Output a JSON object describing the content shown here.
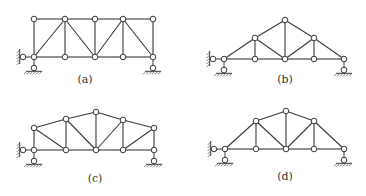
{
  "figure": {
    "node_radius": 2.8,
    "colors": {
      "line": "#3a3a3a",
      "node_fill": "#ffffff",
      "background": "#ffffff"
    },
    "panels": [
      {
        "id": "a",
        "label": "(a)",
        "label_pos": [
          85,
          83
        ],
        "nodes": {
          "B1": [
            34,
            57
          ],
          "B2": [
            65,
            57
          ],
          "B3": [
            95,
            57
          ],
          "B4": [
            123,
            57
          ],
          "B5": [
            153,
            57
          ],
          "T1": [
            34,
            19
          ],
          "T2": [
            65,
            19
          ],
          "T3": [
            95,
            19
          ],
          "T4": [
            123,
            19
          ],
          "T5": [
            153,
            19
          ]
        },
        "members": [
          [
            "B1",
            "B2"
          ],
          [
            "B2",
            "B3"
          ],
          [
            "B3",
            "B4"
          ],
          [
            "B4",
            "B5"
          ],
          [
            "T1",
            "T2"
          ],
          [
            "T2",
            "T3"
          ],
          [
            "T3",
            "T4"
          ],
          [
            "T4",
            "T5"
          ],
          [
            "B1",
            "T1"
          ],
          [
            "B2",
            "T2"
          ],
          [
            "B3",
            "T3"
          ],
          [
            "B4",
            "T4"
          ],
          [
            "B5",
            "T5"
          ],
          [
            "B1",
            "T2"
          ],
          [
            "T2",
            "B3"
          ],
          [
            "B3",
            "T4"
          ],
          [
            "T4",
            "B5"
          ]
        ],
        "supports": [
          {
            "type": "pin-horizontal",
            "node": "B1",
            "x": 23
          },
          {
            "type": "pin-vertical",
            "node": "B1"
          },
          {
            "type": "pin-vertical",
            "node": "B5"
          }
        ]
      },
      {
        "id": "b",
        "label": "(b)",
        "label_pos": [
          285,
          83
        ],
        "nodes": {
          "B1": [
            224,
            59
          ],
          "B2": [
            255,
            59
          ],
          "B3": [
            285,
            59
          ],
          "B4": [
            314,
            59
          ],
          "B5": [
            344,
            59
          ],
          "T2": [
            255,
            38
          ],
          "T3": [
            285,
            20
          ],
          "T4": [
            314,
            38
          ]
        },
        "members": [
          [
            "B1",
            "B2"
          ],
          [
            "B2",
            "B3"
          ],
          [
            "B3",
            "B4"
          ],
          [
            "B4",
            "B5"
          ],
          [
            "B1",
            "T2"
          ],
          [
            "T2",
            "T3"
          ],
          [
            "T3",
            "T4"
          ],
          [
            "T4",
            "B5"
          ],
          [
            "B2",
            "T2"
          ],
          [
            "B3",
            "T3"
          ],
          [
            "B4",
            "T4"
          ],
          [
            "T2",
            "B3"
          ],
          [
            "B3",
            "T4"
          ]
        ],
        "supports": [
          {
            "type": "pin-horizontal",
            "node": "B1",
            "x": 213
          },
          {
            "type": "pin-vertical",
            "node": "B1"
          },
          {
            "type": "pin-vertical",
            "node": "B5"
          }
        ]
      },
      {
        "id": "c",
        "label": "(c)",
        "label_pos": [
          95,
          182
        ],
        "nodes": {
          "B1": [
            34,
            150
          ],
          "B2": [
            66,
            150
          ],
          "B3": [
            96,
            150
          ],
          "B4": [
            123,
            150
          ],
          "B5": [
            154,
            150
          ],
          "T1": [
            34,
            128
          ],
          "T2": [
            66,
            119
          ],
          "T3": [
            96,
            112
          ],
          "T4": [
            123,
            120
          ],
          "T5": [
            154,
            128
          ]
        },
        "members": [
          [
            "B1",
            "B2"
          ],
          [
            "B2",
            "B3"
          ],
          [
            "B3",
            "B4"
          ],
          [
            "B4",
            "B5"
          ],
          [
            "T1",
            "T2"
          ],
          [
            "T2",
            "T3"
          ],
          [
            "T3",
            "T4"
          ],
          [
            "T4",
            "T5"
          ],
          [
            "B1",
            "T1"
          ],
          [
            "B2",
            "T2"
          ],
          [
            "B3",
            "T3"
          ],
          [
            "B4",
            "T4"
          ],
          [
            "B5",
            "T5"
          ],
          [
            "T1",
            "B2"
          ],
          [
            "T2",
            "B3"
          ],
          [
            "T4",
            "B3"
          ],
          [
            "T5",
            "B4"
          ]
        ],
        "supports": [
          {
            "type": "pin-horizontal",
            "node": "B1",
            "x": 23
          },
          {
            "type": "pin-vertical",
            "node": "B1"
          },
          {
            "type": "pin-vertical",
            "node": "B5"
          }
        ]
      },
      {
        "id": "d",
        "label": "(d)",
        "label_pos": [
          285,
          180
        ],
        "nodes": {
          "B1": [
            225,
            149
          ],
          "B2": [
            256,
            149
          ],
          "B3": [
            286,
            149
          ],
          "B4": [
            314,
            149
          ],
          "B5": [
            344,
            149
          ],
          "T2": [
            256,
            121
          ],
          "T3": [
            286,
            111
          ],
          "T4": [
            314,
            121
          ]
        },
        "members": [
          [
            "B1",
            "B2"
          ],
          [
            "B2",
            "B3"
          ],
          [
            "B3",
            "B4"
          ],
          [
            "B4",
            "B5"
          ],
          [
            "B1",
            "T2"
          ],
          [
            "T2",
            "T3"
          ],
          [
            "T3",
            "T4"
          ],
          [
            "T4",
            "B5"
          ],
          [
            "B2",
            "T2"
          ],
          [
            "B3",
            "T3"
          ],
          [
            "B4",
            "T4"
          ],
          [
            "T2",
            "B3"
          ],
          [
            "B3",
            "T4"
          ]
        ],
        "supports": [
          {
            "type": "pin-horizontal",
            "node": "B1",
            "x": 214
          },
          {
            "type": "pin-vertical",
            "node": "B1"
          },
          {
            "type": "pin-vertical",
            "node": "B5"
          }
        ]
      }
    ]
  }
}
